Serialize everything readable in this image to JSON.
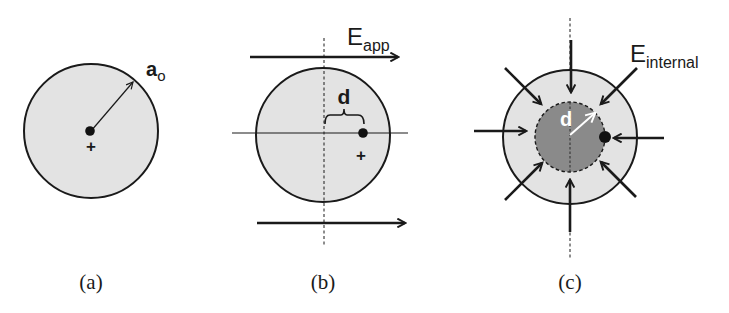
{
  "figure": {
    "panels": [
      {
        "id": "a",
        "caption": "(a)",
        "radius_label": {
          "main": "a",
          "sub": "o"
        },
        "nucleus_sign": "+"
      },
      {
        "id": "b",
        "caption": "(b)",
        "displacement_label": "d",
        "field_label": {
          "main": "E",
          "sub": "app"
        },
        "nucleus_sign": "+"
      },
      {
        "id": "c",
        "caption": "(c)",
        "displacement_label": "d",
        "field_label": {
          "main": "E",
          "sub": "internal"
        }
      }
    ],
    "colors": {
      "electron_cloud": "#e3e3e3",
      "displaced_core": "#8a8a8a",
      "stroke": "#1a1a1a",
      "inner_arrow": "#ffffff"
    }
  }
}
